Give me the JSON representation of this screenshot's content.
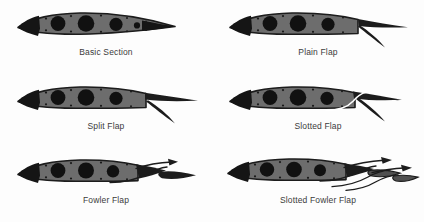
{
  "figure": {
    "background_color": "#fdfdfd",
    "columns": 2,
    "rows": 3
  },
  "style": {
    "airfoil_body_color": "#6d6d6d",
    "airfoil_edge_color": "#1c1c1c",
    "hole_color": "#111111",
    "rivet_color": "#1a1a1a",
    "flap_color": "#1c1c1c",
    "slot_line_color": "#ffffff",
    "arrow_color": "#1c1c1c",
    "caption_color": "#3b3b3b"
  },
  "panels": [
    {
      "id": "basic-section",
      "label": "Basic Section",
      "row": 0,
      "column": 0,
      "description": "Undeflected airfoil cross section with lightening holes and rivets",
      "flap_deflection_deg": 0,
      "elements": [
        "airfoil",
        "lightening-holes",
        "rivets"
      ],
      "arrows": 0,
      "slot_lines": 0,
      "flap_elements": 0
    },
    {
      "id": "plain-flap",
      "label": "Plain Flap",
      "row": 0,
      "column": 1,
      "description": "Rear portion of airfoil hinged downward as one piece",
      "flap_deflection_deg": 35,
      "elements": [
        "airfoil",
        "lightening-holes",
        "rivets",
        "hinged-flap"
      ],
      "arrows": 0,
      "slot_lines": 0,
      "flap_elements": 1
    },
    {
      "id": "split-flap",
      "label": "Split Flap",
      "row": 1,
      "column": 0,
      "description": "Lower surface panel deflects while upper surface stays fixed",
      "flap_deflection_deg": 40,
      "elements": [
        "airfoil",
        "lightening-holes",
        "rivets",
        "split-lower-panel"
      ],
      "arrows": 0,
      "slot_lines": 0,
      "flap_elements": 1
    },
    {
      "id": "slotted-flap",
      "label": "Slotted Flap",
      "row": 1,
      "column": 1,
      "description": "Flap deflects leaving a slot that ducts air from lower to upper surface",
      "flap_deflection_deg": 40,
      "elements": [
        "airfoil",
        "lightening-holes",
        "rivets",
        "slotted-flap",
        "slot-airflow-line"
      ],
      "arrows": 0,
      "slot_lines": 1,
      "flap_elements": 1
    },
    {
      "id": "fowler-flap",
      "label": "Fowler Flap",
      "row": 2,
      "column": 0,
      "description": "Flap translates aft along a track and deflects, increasing wing area",
      "flap_deflection_deg": 30,
      "elements": [
        "airfoil",
        "lightening-holes",
        "rivets",
        "fowler-flap",
        "translation-arrow",
        "track-line"
      ],
      "arrows": 1,
      "slot_lines": 1,
      "flap_elements": 1
    },
    {
      "id": "slotted-fowler-flap",
      "label": "Slotted Fowler Flap",
      "row": 2,
      "column": 1,
      "description": "Double-slotted Fowler flap: two elements translate aft and deflect",
      "flap_deflection_deg": 40,
      "elements": [
        "airfoil",
        "lightening-holes",
        "rivets",
        "fowler-vane",
        "fowler-flap",
        "translation-arrows",
        "track-lines"
      ],
      "arrows": 2,
      "slot_lines": 2,
      "flap_elements": 2
    }
  ]
}
